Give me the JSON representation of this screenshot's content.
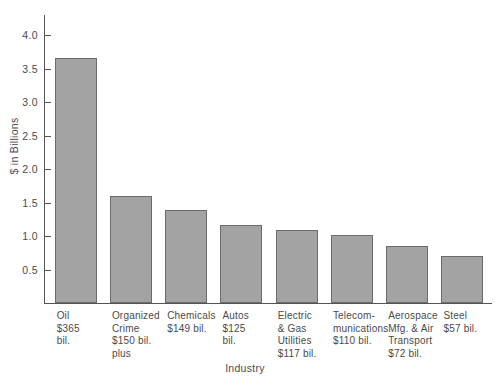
{
  "chart_data": {
    "type": "bar",
    "title": "",
    "xlabel": "Industry",
    "ylabel": "$ in Billions",
    "ylim": [
      0,
      4.0
    ],
    "ytick_values": [
      4.0,
      3.5,
      3.0,
      2.5,
      2.0,
      1.5,
      1.0,
      0.5
    ],
    "ytick_labels": [
      "4.0",
      "3.5",
      "3.0",
      "2.5",
      "2.0",
      "1.5",
      "1.0",
      "0.5"
    ],
    "grid": false,
    "legend": "none",
    "bar_color": "#a3a3a3",
    "bar_edge_color": "#6b6b6b",
    "axis_color": "#555555",
    "categories": [
      "Oil",
      "Organized Crime",
      "Chemicals",
      "Autos",
      "Electric & Gas Utilities",
      "Telecommunications",
      "Aerospace Mfg. & Air Transport",
      "Steel"
    ],
    "values": [
      3.65,
      1.6,
      1.39,
      1.17,
      1.09,
      1.02,
      0.85,
      0.7
    ],
    "tick_labels": [
      "Oil\n$365\nbil.",
      "Organized\nCrime\n$150 bil.\nplus",
      "Chemicals\n$149 bil.",
      "Autos\n$125\nbil.",
      "Electric\n& Gas\nUtilities\n$117 bil.",
      "Telecom-\nmunications\n$110 bil.",
      "Aerospace\nMfg. & Air\nTransport\n$72 bil.",
      "Steel\n$57 bil."
    ],
    "annotations": [
      "Oil $365 bil.",
      "Organized Crime $150 bil. plus",
      "Chemicals $149 bil.",
      "Autos $125 bil.",
      "Electric & Gas Utilities $117 bil.",
      "Telecommunications $110 bil.",
      "Aerospace Mfg. & Air Transport $72 bil.",
      "Steel $57 bil."
    ]
  }
}
